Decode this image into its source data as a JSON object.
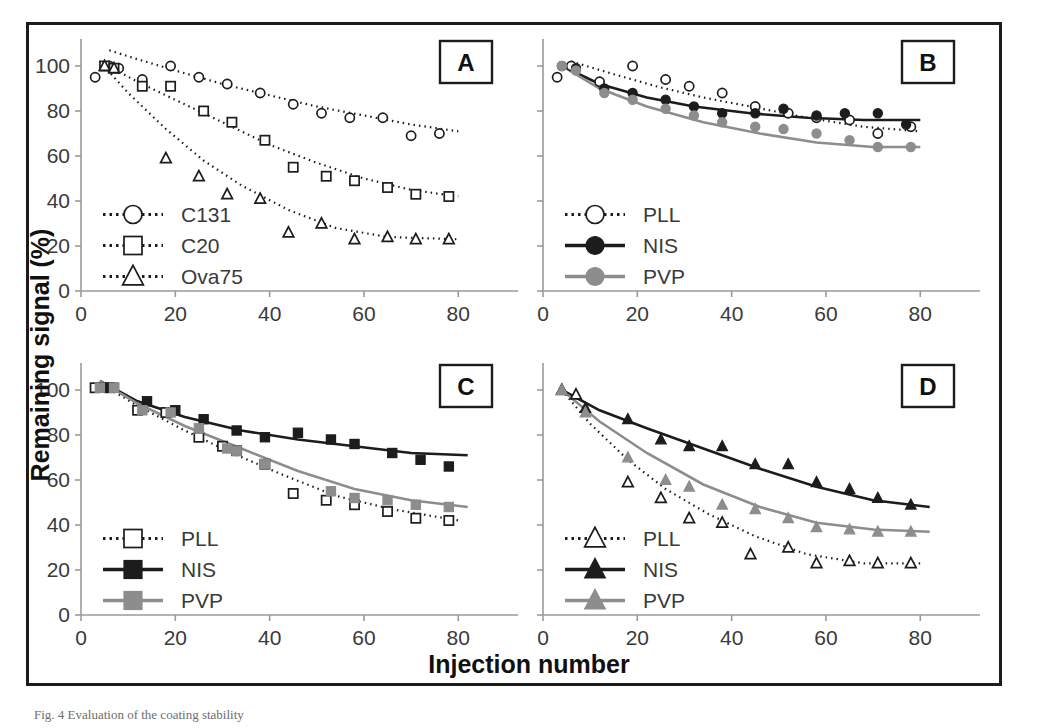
{
  "figure": {
    "xlabel": "Injection number",
    "ylabel": "Remaining signal (%)",
    "caption": "Fig. 4  Evaluation of the coating stability",
    "colors": {
      "black": "#1c1c1c",
      "gray": "#8d8d8d",
      "open": "#ffffff",
      "axis": "#9a9a9a",
      "text": "#3a3a3a"
    },
    "panel_labels": [
      "A",
      "B",
      "C",
      "D"
    ]
  },
  "chart_data": [
    {
      "type": "scatter",
      "panel": "A",
      "title": "",
      "xlabel": "Injection number",
      "ylabel": "Remaining signal (%)",
      "xlim": [
        0,
        88
      ],
      "ylim": [
        0,
        112
      ],
      "xticks": [
        0,
        20,
        40,
        60,
        80
      ],
      "yticks": [
        0,
        20,
        40,
        60,
        80,
        100
      ],
      "grid": false,
      "legend_position": "lower-left",
      "series": [
        {
          "name": "C131",
          "marker": "open-circle",
          "line": "dotted",
          "color": "#1c1c1c",
          "x": [
            3,
            6,
            8,
            13,
            19,
            25,
            31,
            38,
            45,
            51,
            57,
            64,
            70,
            76
          ],
          "y": [
            95,
            100,
            99,
            94,
            100,
            95,
            92,
            88,
            83,
            79,
            77,
            77,
            69,
            70
          ],
          "fit_x": [
            6,
            12,
            20,
            30,
            40,
            50,
            60,
            70,
            80
          ],
          "fit_y": [
            107,
            103,
            98,
            92,
            87,
            82,
            78,
            74,
            71
          ]
        },
        {
          "name": "C20",
          "marker": "open-square",
          "line": "dotted",
          "color": "#1c1c1c",
          "x": [
            5,
            7,
            13,
            19,
            26,
            32,
            39,
            45,
            52,
            58,
            65,
            71,
            78
          ],
          "y": [
            100,
            99,
            91,
            91,
            80,
            75,
            67,
            55,
            51,
            49,
            46,
            43,
            42
          ],
          "fit_x": [
            4,
            12,
            20,
            30,
            40,
            50,
            60,
            70,
            80
          ],
          "fit_y": [
            102,
            93,
            85,
            75,
            65,
            57,
            50,
            45,
            42
          ]
        },
        {
          "name": "Ova75",
          "marker": "open-triangle",
          "line": "dotted",
          "color": "#1c1c1c",
          "x": [
            5,
            7,
            18,
            25,
            31,
            38,
            44,
            51,
            58,
            65,
            71,
            78
          ],
          "y": [
            100,
            99,
            59,
            51,
            43,
            41,
            26,
            30,
            23,
            24,
            23,
            23
          ],
          "fit_x": [
            4,
            10,
            18,
            26,
            34,
            44,
            54,
            65,
            80
          ],
          "fit_y": [
            102,
            88,
            72,
            58,
            47,
            36,
            28,
            24,
            23
          ]
        }
      ]
    },
    {
      "type": "scatter",
      "panel": "B",
      "title": "",
      "xlabel": "Injection number",
      "ylabel": "Remaining signal (%)",
      "xlim": [
        0,
        88
      ],
      "ylim": [
        0,
        112
      ],
      "xticks": [
        0,
        20,
        40,
        60,
        80
      ],
      "yticks": [
        0,
        20,
        40,
        60,
        80,
        100
      ],
      "grid": false,
      "legend_position": "lower-left",
      "series": [
        {
          "name": "PLL",
          "marker": "open-circle",
          "line": "dotted",
          "color": "#1c1c1c",
          "x": [
            3,
            6,
            12,
            19,
            26,
            31,
            38,
            45,
            52,
            58,
            65,
            71,
            78
          ],
          "y": [
            95,
            100,
            93,
            100,
            94,
            91,
            88,
            82,
            79,
            77,
            76,
            70,
            73
          ],
          "fit_x": [
            6,
            14,
            24,
            34,
            44,
            56,
            68,
            80
          ],
          "fit_y": [
            102,
            97,
            91,
            86,
            82,
            77,
            73,
            71
          ]
        },
        {
          "name": "NIS",
          "marker": "filled-circle",
          "line": "solid",
          "color": "#1c1c1c",
          "x": [
            4,
            7,
            13,
            19,
            26,
            32,
            38,
            45,
            51,
            58,
            64,
            71,
            77
          ],
          "y": [
            100,
            99,
            90,
            88,
            85,
            82,
            79,
            79,
            81,
            78,
            79,
            79,
            74
          ],
          "fit_x": [
            4,
            12,
            22,
            32,
            44,
            56,
            68,
            80
          ],
          "fit_y": [
            100,
            92,
            86,
            82,
            79,
            77,
            76,
            76
          ]
        },
        {
          "name": "PVP",
          "marker": "filled-circle",
          "line": "solid",
          "color": "#8d8d8d",
          "x": [
            4,
            7,
            13,
            19,
            26,
            32,
            38,
            45,
            51,
            58,
            65,
            71,
            78
          ],
          "y": [
            100,
            98,
            88,
            85,
            81,
            78,
            75,
            73,
            72,
            70,
            67,
            64,
            64
          ],
          "fit_x": [
            4,
            12,
            22,
            34,
            46,
            58,
            70,
            80
          ],
          "fit_y": [
            100,
            90,
            82,
            75,
            70,
            66,
            64,
            64
          ]
        }
      ]
    },
    {
      "type": "scatter",
      "panel": "C",
      "title": "",
      "xlabel": "Injection number",
      "ylabel": "Remaining signal (%)",
      "xlim": [
        0,
        88
      ],
      "ylim": [
        0,
        112
      ],
      "xticks": [
        0,
        20,
        40,
        60,
        80
      ],
      "yticks": [
        0,
        20,
        40,
        60,
        80,
        100
      ],
      "grid": false,
      "legend_position": "lower-left",
      "series": [
        {
          "name": "PLL",
          "marker": "open-square",
          "line": "dotted",
          "color": "#1c1c1c",
          "x": [
            3,
            6,
            12,
            18,
            25,
            30,
            33,
            39,
            45,
            52,
            58,
            65,
            71,
            78
          ],
          "y": [
            101,
            101,
            91,
            90,
            79,
            75,
            73,
            67,
            54,
            51,
            49,
            46,
            43,
            42
          ],
          "fit_x": [
            4,
            12,
            22,
            32,
            42,
            54,
            66,
            80
          ],
          "fit_y": [
            103,
            93,
            82,
            72,
            63,
            53,
            47,
            42
          ]
        },
        {
          "name": "NIS",
          "marker": "filled-square",
          "line": "solid",
          "color": "#1c1c1c",
          "x": [
            5,
            7,
            14,
            20,
            26,
            33,
            39,
            46,
            53,
            58,
            66,
            72,
            78
          ],
          "y": [
            101,
            101,
            95,
            91,
            87,
            82,
            79,
            81,
            78,
            76,
            72,
            69,
            66
          ],
          "fit_x": [
            4,
            12,
            22,
            34,
            46,
            58,
            70,
            82
          ],
          "fit_y": [
            104,
            95,
            88,
            82,
            78,
            75,
            72,
            71
          ]
        },
        {
          "name": "PVP",
          "marker": "filled-square",
          "line": "solid",
          "color": "#8d8d8d",
          "x": [
            4,
            7,
            13,
            19,
            25,
            31,
            33,
            39,
            53,
            58,
            65,
            71,
            78
          ],
          "y": [
            101,
            101,
            91,
            90,
            83,
            74,
            73,
            67,
            55,
            52,
            51,
            49,
            48
          ],
          "fit_x": [
            4,
            12,
            22,
            34,
            46,
            58,
            70,
            82
          ],
          "fit_y": [
            104,
            94,
            84,
            74,
            64,
            56,
            51,
            48
          ]
        }
      ]
    },
    {
      "type": "scatter",
      "panel": "D",
      "title": "",
      "xlabel": "Injection number",
      "ylabel": "Remaining signal (%)",
      "xlim": [
        0,
        88
      ],
      "ylim": [
        0,
        112
      ],
      "xticks": [
        0,
        20,
        40,
        60,
        80
      ],
      "yticks": [
        0,
        20,
        40,
        60,
        80,
        100
      ],
      "grid": false,
      "legend_position": "lower-left",
      "series": [
        {
          "name": "PLL",
          "marker": "open-triangle",
          "line": "dotted",
          "color": "#1c1c1c",
          "x": [
            4,
            7,
            18,
            25,
            31,
            38,
            44,
            52,
            58,
            65,
            71,
            78
          ],
          "y": [
            100,
            98,
            59,
            52,
            43,
            41,
            27,
            30,
            23,
            24,
            23,
            23
          ],
          "fit_x": [
            4,
            10,
            18,
            26,
            35,
            45,
            56,
            68,
            80
          ],
          "fit_y": [
            100,
            85,
            69,
            56,
            45,
            35,
            27,
            23,
            23
          ]
        },
        {
          "name": "NIS",
          "marker": "filled-triangle",
          "line": "solid",
          "color": "#1c1c1c",
          "x": [
            4,
            9,
            18,
            25,
            31,
            38,
            45,
            52,
            58,
            65,
            71,
            78
          ],
          "y": [
            100,
            92,
            87,
            78,
            75,
            75,
            67,
            67,
            59,
            56,
            52,
            49
          ],
          "fit_x": [
            4,
            12,
            22,
            34,
            46,
            58,
            70,
            82
          ],
          "fit_y": [
            100,
            91,
            83,
            74,
            65,
            57,
            51,
            48
          ]
        },
        {
          "name": "PVP",
          "marker": "filled-triangle",
          "line": "solid",
          "color": "#8d8d8d",
          "x": [
            4,
            9,
            18,
            26,
            31,
            38,
            45,
            52,
            58,
            65,
            71,
            78
          ],
          "y": [
            100,
            90,
            70,
            60,
            57,
            49,
            47,
            43,
            39,
            38,
            37,
            37
          ],
          "fit_x": [
            4,
            12,
            22,
            34,
            46,
            58,
            70,
            82
          ],
          "fit_y": [
            100,
            86,
            72,
            58,
            48,
            41,
            38,
            37
          ]
        }
      ]
    }
  ]
}
